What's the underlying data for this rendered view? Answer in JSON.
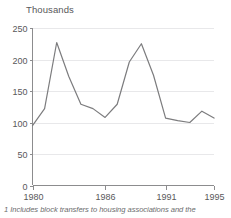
{
  "chart_data": {
    "type": "line",
    "title": "Thousands",
    "xlabel": "",
    "ylabel": "Thousands",
    "x": [
      1980,
      1981,
      1982,
      1983,
      1984,
      1985,
      1986,
      1987,
      1988,
      1989,
      1990,
      1991,
      1992,
      1993,
      1994,
      1995
    ],
    "values": [
      95,
      122,
      227,
      173,
      129,
      122,
      108,
      129,
      196,
      225,
      175,
      107,
      103,
      100,
      118,
      107
    ],
    "series": [
      {
        "name": "Dwellings",
        "values": [
          95,
          122,
          227,
          173,
          129,
          122,
          108,
          129,
          196,
          225,
          175,
          107,
          103,
          100,
          118,
          107
        ]
      }
    ],
    "xlim": [
      1980,
      1995
    ],
    "ylim": [
      0,
      250
    ],
    "ytick_labels": [
      "0",
      "50",
      "100",
      "150",
      "200",
      "250"
    ],
    "ytick_values": [
      0,
      50,
      100,
      150,
      200,
      250
    ],
    "xtick_labels": [
      "1980",
      "1986",
      "1991",
      "1995"
    ],
    "xtick_values": [
      1980,
      1986,
      1991,
      1995
    ],
    "grid": true,
    "grid_axis": "y",
    "legend": false,
    "legend_position": "none",
    "line_color": "#7c7c7e",
    "grid_color": "#e8e8ea",
    "axis_color": "#8c8c8e",
    "text_color": "#58585a"
  },
  "axis_title": "Thousands",
  "footnote": "1 Includes block transfers to housing associations and the",
  "y_ticks": [
    {
      "label": "250",
      "value": 250
    },
    {
      "label": "200",
      "value": 200
    },
    {
      "label": "150",
      "value": 150
    },
    {
      "label": "100",
      "value": 100
    },
    {
      "label": "50",
      "value": 50
    },
    {
      "label": "0",
      "value": 0
    }
  ],
  "x_ticks": [
    {
      "label": "1980",
      "value": 1980
    },
    {
      "label": "1986",
      "value": 1986
    },
    {
      "label": "1991",
      "value": 1991
    },
    {
      "label": "1995",
      "value": 1995
    }
  ]
}
